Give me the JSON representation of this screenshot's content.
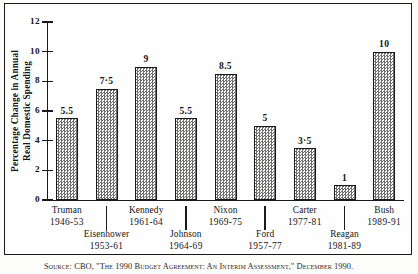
{
  "chart_data": {
    "type": "bar",
    "title": "",
    "xlabel": "",
    "ylabel": "Percentage Change in Annual Real Domestic Spending",
    "ylabel_lines": [
      "Percentage Change in Annual",
      "Real Domestic Spending"
    ],
    "ylim": [
      0,
      12
    ],
    "yticks": [
      0,
      2,
      4,
      6,
      8,
      10,
      12
    ],
    "ytick_labels": [
      "0",
      "2",
      "4",
      "6",
      "8",
      "10",
      "12"
    ],
    "grid": false,
    "legend": "none",
    "categories": [
      "Truman",
      "Eisenhower",
      "Kennedy",
      "Johnson",
      "Nixon",
      "Ford",
      "Carter",
      "Reagan",
      "Bush"
    ],
    "category_years": [
      "1946-53",
      "1953-61",
      "1961-64",
      "1964-69",
      "1969-75",
      "1957-77",
      "1977-81",
      "1981-89",
      "1989-91"
    ],
    "values": [
      5.5,
      7.5,
      9,
      5.5,
      8.5,
      5,
      3.5,
      1,
      10
    ],
    "value_labels": [
      "5.5",
      "7·5",
      "9",
      "5.5",
      "8.5",
      "5",
      "3·5",
      "1",
      "10"
    ],
    "bar_color": "#e9e9e6",
    "bar_edge_color": "#1a1a1a",
    "bar_fill_pattern": "checkerboard-hatch"
  },
  "source": {
    "note": "Source: CBO, \"The 1990 Budget Agreement: An Interim Assessment,\" December 1990."
  }
}
